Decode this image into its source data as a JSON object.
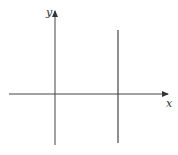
{
  "diagram": {
    "type": "coordinate-axes",
    "x_axis_label": "x",
    "y_axis_label": "y",
    "colors": {
      "axis": "#444444",
      "line": "#444444",
      "label": "#333333",
      "background": "#ffffff"
    },
    "elements": [
      {
        "name": "x-axis",
        "description": "horizontal axis with arrow pointing right"
      },
      {
        "name": "y-axis",
        "description": "vertical axis with arrow pointing up"
      },
      {
        "name": "vertical-line",
        "description": "vertical line to the right of the y-axis, crossing the x-axis"
      }
    ]
  }
}
